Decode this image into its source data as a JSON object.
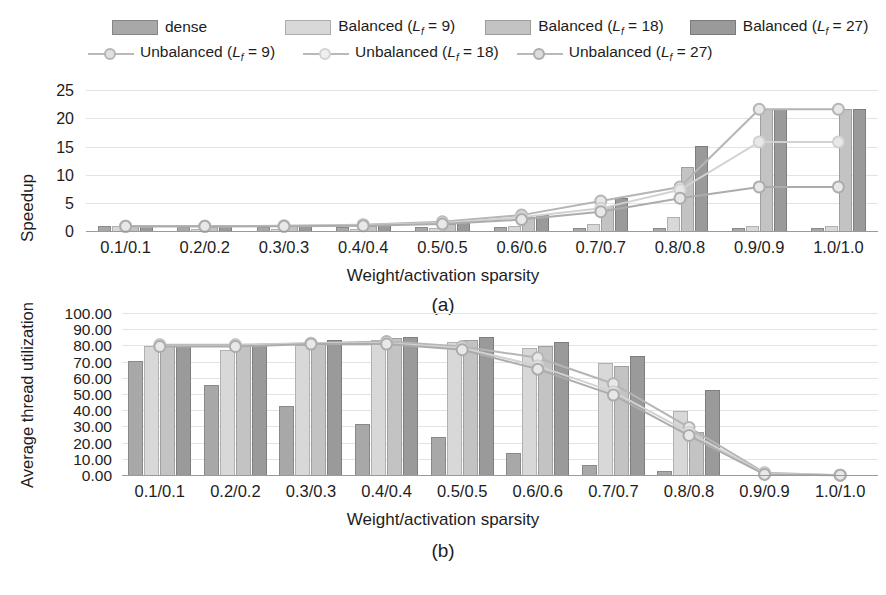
{
  "legend": {
    "items": [
      {
        "name": "dense",
        "label": "dense",
        "type": "bar",
        "color": "#a8a8a8"
      },
      {
        "name": "balanced-9",
        "label": "Balanced (L_f = 9)",
        "label_pre": "Balanced (",
        "label_var": "L",
        "label_sub": "f",
        "label_post": " = 9)",
        "type": "bar",
        "color": "#d8d8d8"
      },
      {
        "name": "balanced-18",
        "label": "Balanced (L_f = 18)",
        "label_pre": "Balanced (",
        "label_var": "L",
        "label_sub": "f",
        "label_post": " = 18)",
        "type": "bar",
        "color": "#c3c3c3"
      },
      {
        "name": "balanced-27",
        "label": "Balanced (L_f = 27)",
        "label_pre": "Balanced (",
        "label_var": "L",
        "label_sub": "f",
        "label_post": " = 27)",
        "type": "bar",
        "color": "#9a9a9a"
      },
      {
        "name": "unbalanced-9",
        "label": "Unbalanced (L_f = 9)",
        "label_pre": "Unbalanced (",
        "label_var": "L",
        "label_sub": "f",
        "label_post": " = 9)",
        "type": "line",
        "color": "#b5b5b5"
      },
      {
        "name": "unbalanced-18",
        "label": "Unbalanced (L_f = 18)",
        "label_pre": "Unbalanced (",
        "label_var": "L",
        "label_sub": "f",
        "label_post": " = 18)",
        "type": "line",
        "color": "#d2d2d2"
      },
      {
        "name": "unbalanced-27",
        "label": "Unbalanced (L_f = 27)",
        "label_pre": "Unbalanced (",
        "label_var": "L",
        "label_sub": "f",
        "label_post": " = 27)",
        "type": "line",
        "color": "#acacac"
      }
    ]
  },
  "chart_data": [
    {
      "id": "a",
      "type": "bar",
      "caption": "(a)",
      "title": "",
      "xlabel": "Weight/activation sparsity",
      "ylabel": "Speedup",
      "categories": [
        "0.1/0.1",
        "0.2/0.2",
        "0.3/0.3",
        "0.4/0.4",
        "0.5/0.5",
        "0.6/0.6",
        "0.7/0.7",
        "0.8/0.8",
        "0.9/0.9",
        "1.0/1.0"
      ],
      "ylim": [
        0,
        27
      ],
      "yticks": [
        0,
        5,
        10,
        15,
        20,
        25
      ],
      "ytick_labels": [
        "0",
        "5",
        "10",
        "15",
        "20",
        "25"
      ],
      "grid": true,
      "legend_position": "top",
      "bar_series": [
        {
          "name": "dense",
          "values": [
            1.0,
            0.95,
            0.9,
            0.88,
            0.85,
            0.82,
            0.8,
            0.78,
            0.75,
            0.72
          ],
          "color": "#a8a8a8"
        },
        {
          "name": "Balanced (Lf = 9)",
          "values": [
            1.0,
            0.6,
            0.6,
            0.6,
            0.8,
            1.0,
            1.5,
            2.6,
            1.0,
            1.0
          ],
          "color": "#d8d8d8"
        },
        {
          "name": "Balanced (Lf = 18)",
          "values": [
            1.05,
            0.95,
            1.0,
            1.15,
            1.5,
            2.6,
            4.6,
            11.5,
            21.8,
            21.8
          ],
          "color": "#c3c3c3"
        },
        {
          "name": "Balanced (Lf = 27)",
          "values": [
            1.1,
            1.05,
            1.1,
            1.3,
            1.8,
            3.1,
            6.0,
            15.3,
            21.8,
            21.8
          ],
          "color": "#9a9a9a"
        }
      ],
      "line_series": [
        {
          "name": "Unbalanced (Lf = 9)",
          "values": [
            1.0,
            1.0,
            1.1,
            1.3,
            1.8,
            3.0,
            5.5,
            8.0,
            21.8,
            21.8
          ],
          "color": "#b5b5b5"
        },
        {
          "name": "Unbalanced (Lf = 18)",
          "values": [
            1.0,
            1.0,
            1.05,
            1.2,
            1.6,
            2.6,
            4.2,
            7.5,
            16.0,
            16.0
          ],
          "color": "#d2d2d2"
        },
        {
          "name": "Unbalanced (Lf = 27)",
          "values": [
            1.0,
            1.0,
            1.0,
            1.1,
            1.4,
            2.2,
            3.6,
            6.0,
            8.0,
            8.0
          ],
          "color": "#acacac"
        }
      ]
    },
    {
      "id": "b",
      "type": "bar",
      "caption": "(b)",
      "title": "",
      "xlabel": "Weight/activation sparsity",
      "ylabel": "Average thread utilization",
      "categories": [
        "0.1/0.1",
        "0.2/0.2",
        "0.3/0.3",
        "0.4/0.4",
        "0.5/0.5",
        "0.6/0.6",
        "0.7/0.7",
        "0.8/0.8",
        "0.9/0.9",
        "1.0/1.0"
      ],
      "ylim": [
        0,
        105
      ],
      "yticks": [
        0,
        10,
        20,
        30,
        40,
        50,
        60,
        70,
        80,
        90,
        100
      ],
      "ytick_labels": [
        "0.00",
        "10.00",
        "20.00",
        "30.00",
        "40.00",
        "50.00",
        "60.00",
        "70.00",
        "80.00",
        "90.00",
        "100.00"
      ],
      "grid": true,
      "legend_position": "top",
      "bar_series": [
        {
          "name": "dense",
          "values": [
            71.0,
            56.0,
            43.0,
            32.0,
            24.0,
            14.0,
            7.0,
            3.0,
            0.0,
            0.0
          ],
          "color": "#a8a8a8"
        },
        {
          "name": "Balanced (Lf = 9)",
          "values": [
            80.0,
            78.0,
            81.0,
            84.0,
            83.0,
            79.0,
            70.0,
            40.0,
            0.0,
            0.0
          ],
          "color": "#d8d8d8"
        },
        {
          "name": "Balanced (Lf = 18)",
          "values": [
            81.0,
            80.0,
            82.0,
            85.0,
            84.0,
            80.0,
            68.0,
            27.0,
            0.0,
            0.0
          ],
          "color": "#c3c3c3"
        },
        {
          "name": "Balanced (Lf = 27)",
          "values": [
            81.0,
            81.0,
            84.0,
            86.0,
            86.0,
            83.0,
            74.0,
            53.0,
            0.0,
            0.0
          ],
          "color": "#9a9a9a"
        }
      ],
      "line_series": [
        {
          "name": "Unbalanced (Lf = 9)",
          "values": [
            81.0,
            81.0,
            82.0,
            83.0,
            80.0,
            73.0,
            57.0,
            30.0,
            2.0,
            0.5
          ],
          "color": "#b5b5b5"
        },
        {
          "name": "Unbalanced (Lf = 18)",
          "values": [
            80.5,
            80.5,
            82.0,
            82.0,
            79.0,
            68.0,
            52.0,
            27.0,
            1.5,
            0.5
          ],
          "color": "#d2d2d2"
        },
        {
          "name": "Unbalanced (Lf = 27)",
          "values": [
            80.0,
            80.0,
            81.5,
            81.5,
            78.0,
            66.0,
            50.0,
            25.0,
            1.0,
            0.5
          ],
          "color": "#acacac"
        }
      ]
    }
  ]
}
